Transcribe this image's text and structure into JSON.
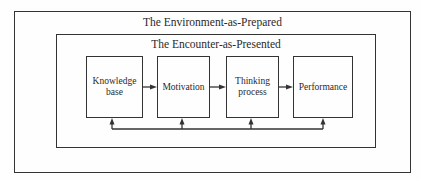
{
  "outer": {
    "title": "The Environment-as-Prepared"
  },
  "inner": {
    "title": "The Encounter-as-Presented"
  },
  "nodes": [
    {
      "label": "Knowledge base"
    },
    {
      "label": "Motivation"
    },
    {
      "label": "Thinking process"
    },
    {
      "label": "Performance"
    }
  ],
  "connections": {
    "forward": [
      "Knowledge base -> Motivation",
      "Motivation -> Thinking process",
      "Thinking process -> Performance"
    ],
    "feedback": "Shared feedback line beneath all four boxes with upward arrows into each box"
  },
  "colors": {
    "line": "#333333",
    "background": "#fefefe",
    "text": "#2a2a2a"
  }
}
